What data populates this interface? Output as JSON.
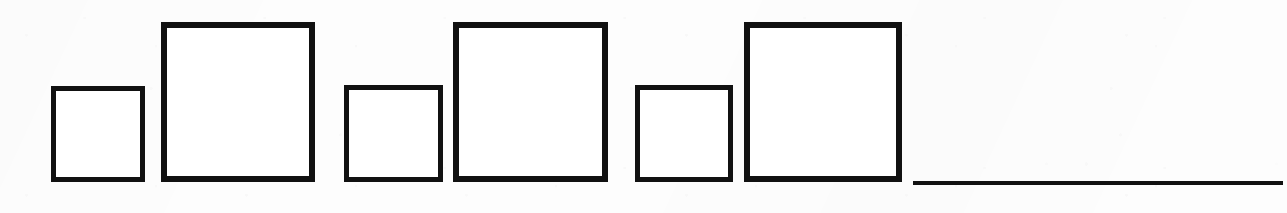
{
  "figure": {
    "width": 1287,
    "height": 213,
    "background_color": "#fdfdfd",
    "stroke_color": "#111111",
    "fill_color": "#ffffff",
    "baseline_y": 182,
    "shape_count": 6,
    "pattern": "alternating small and large squares sharing a common bottom baseline"
  },
  "shapes": [
    {
      "name": "square-1-small",
      "label": "Small square 1",
      "size": "small",
      "x": 51,
      "y": 86,
      "width": 94,
      "height": 96,
      "stroke_width": 5
    },
    {
      "name": "square-2-large",
      "label": "Large square 1",
      "size": "large",
      "x": 161,
      "y": 22,
      "width": 154,
      "height": 160,
      "stroke_width": 6
    },
    {
      "name": "square-3-small",
      "label": "Small square 2",
      "size": "small",
      "x": 344,
      "y": 85,
      "width": 99,
      "height": 97,
      "stroke_width": 5
    },
    {
      "name": "square-4-large",
      "label": "Large square 2",
      "size": "large",
      "x": 453,
      "y": 22,
      "width": 155,
      "height": 160,
      "stroke_width": 6
    },
    {
      "name": "square-5-small",
      "label": "Small square 3",
      "size": "small",
      "x": 635,
      "y": 85,
      "width": 98,
      "height": 97,
      "stroke_width": 5
    },
    {
      "name": "square-6-large",
      "label": "Large square 3",
      "size": "large",
      "x": 744,
      "y": 22,
      "width": 158,
      "height": 160,
      "stroke_width": 6
    }
  ],
  "baseline_rule": {
    "name": "horizontal-rule",
    "label": "Horizontal baseline rule",
    "x": 913,
    "y": 181,
    "width": 370,
    "height": 4
  }
}
